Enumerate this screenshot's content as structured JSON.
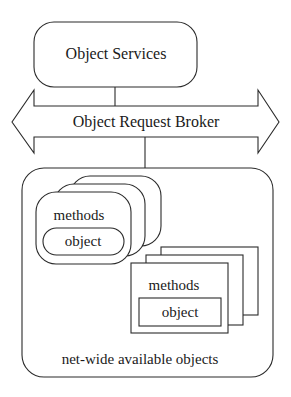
{
  "diagram": {
    "top_box": {
      "label": "Object Services"
    },
    "bus": {
      "label": "Object Request Broker"
    },
    "container": {
      "label": "net-wide available objects"
    },
    "rounded_stack": {
      "count": 3,
      "methods_label": "methods",
      "object_label": "object"
    },
    "rect_stack": {
      "count": 3,
      "methods_label": "methods",
      "object_label": "object"
    },
    "colors": {
      "stroke": "#2a2a2a",
      "fill": "#ffffff",
      "text": "#1a1a1a"
    }
  }
}
